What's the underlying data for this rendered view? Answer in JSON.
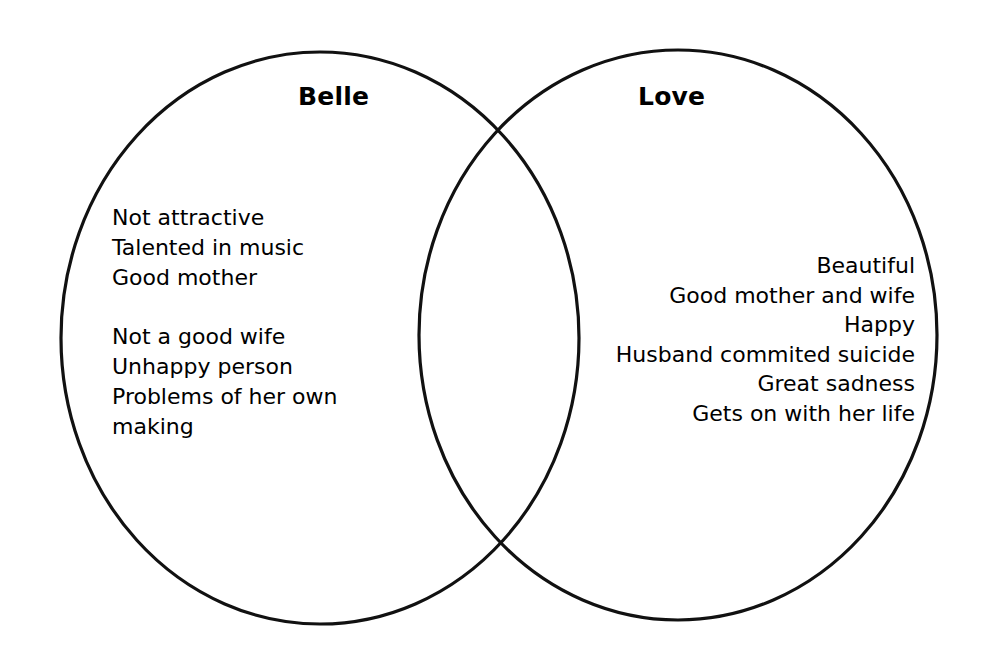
{
  "diagram": {
    "type": "venn",
    "sets": [
      {
        "id": "belle",
        "label": "Belle",
        "items": [
          "Not attractive",
          "Talented in music",
          "Good mother",
          "",
          "Not a good wife",
          "Unhappy person",
          "Problems of her own",
          "making"
        ]
      },
      {
        "id": "love",
        "label": "Love",
        "items": [
          "Beautiful",
          "Good mother and wife",
          "Happy",
          "Husband commited suicide",
          "Great sadness",
          "Gets on with her life"
        ]
      }
    ],
    "overlap": {
      "label": "",
      "items": []
    },
    "colors": {
      "stroke": "#111111",
      "background": "#ffffff",
      "text": "#000000"
    }
  }
}
